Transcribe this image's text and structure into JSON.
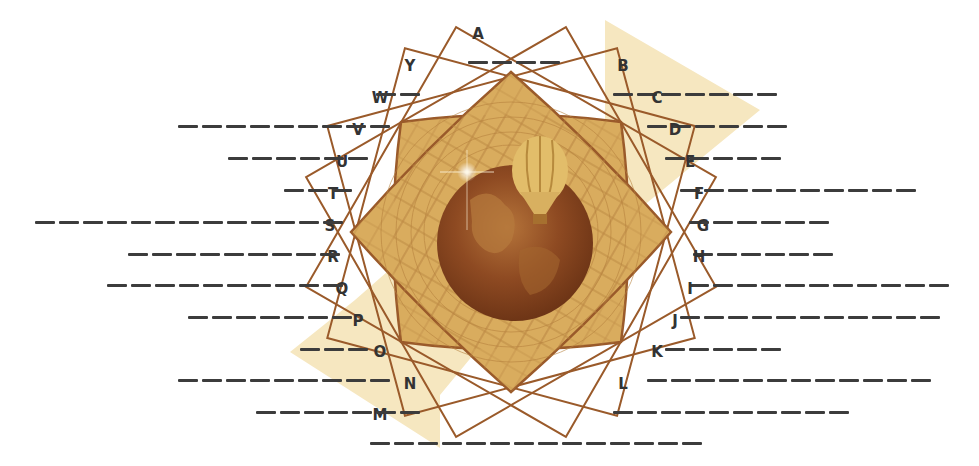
{
  "diagram": {
    "type": "fill-in-the-blank word puzzle around central emblem",
    "emblem": {
      "description": "golden geometric rosette (overlapping rotated squares with lattice) framing a sepia globe with a hot-air balloon and a sparkle",
      "icons": [
        "rosette-emblem",
        "globe-icon",
        "hot-air-balloon-icon",
        "sparkle-icon",
        "diagonal-arrow"
      ]
    },
    "colors": {
      "arrow_band": "#f6e7c0",
      "rosette_fill": "#d9ac5e",
      "rosette_stroke": "#9a5a2a",
      "globe": "#8e4a22",
      "globe_highlight": "#c98a45",
      "dash": "#3c3c3c",
      "letter": "#333333"
    }
  },
  "blanks": [
    {
      "letter": "A",
      "dashes": 4,
      "side": "right",
      "x": 468,
      "y": 44
    },
    {
      "letter": "B",
      "dashes": 7,
      "side": "right",
      "x": 613,
      "y": 76
    },
    {
      "letter": "C",
      "dashes": 6,
      "side": "right",
      "x": 647,
      "y": 108
    },
    {
      "letter": "D",
      "dashes": 5,
      "side": "right",
      "x": 665,
      "y": 140
    },
    {
      "letter": "E",
      "dashes": 10,
      "side": "right",
      "x": 680,
      "y": 172
    },
    {
      "letter": "F",
      "dashes": 6,
      "side": "right",
      "x": 689,
      "y": 204
    },
    {
      "letter": "G",
      "dashes": 6,
      "side": "right",
      "x": 693,
      "y": 236
    },
    {
      "letter": "H",
      "dashes": 11,
      "side": "right",
      "x": 689,
      "y": 267
    },
    {
      "letter": "I",
      "dashes": 11,
      "side": "right",
      "x": 680,
      "y": 299
    },
    {
      "letter": "J",
      "dashes": 5,
      "side": "right",
      "x": 665,
      "y": 331
    },
    {
      "letter": "K",
      "dashes": 12,
      "side": "right",
      "x": 647,
      "y": 362
    },
    {
      "letter": "L",
      "dashes": 10,
      "side": "right",
      "x": 613,
      "y": 394
    },
    {
      "letter": "M",
      "dashes": 14,
      "side": "right",
      "x": 370,
      "y": 425
    },
    {
      "letter": "N",
      "dashes": 7,
      "side": "left",
      "x": 420,
      "y": 394
    },
    {
      "letter": "O",
      "dashes": 9,
      "side": "left",
      "x": 390,
      "y": 362
    },
    {
      "letter": "P",
      "dashes": 3,
      "side": "left",
      "x": 368,
      "y": 331
    },
    {
      "letter": "Q",
      "dashes": 7,
      "side": "left",
      "x": 352,
      "y": 299
    },
    {
      "letter": "R",
      "dashes": 10,
      "side": "left",
      "x": 343,
      "y": 267
    },
    {
      "letter": "S",
      "dashes": 9,
      "side": "left",
      "x": 340,
      "y": 236
    },
    {
      "letter": "T",
      "dashes": 13,
      "side": "left",
      "x": 343,
      "y": 204
    },
    {
      "letter": "U",
      "dashes": 3,
      "side": "left",
      "x": 352,
      "y": 172
    },
    {
      "letter": "V",
      "dashes": 6,
      "side": "left",
      "x": 368,
      "y": 140
    },
    {
      "letter": "W",
      "dashes": 9,
      "side": "left",
      "x": 390,
      "y": 108
    },
    {
      "letter": "Y",
      "dashes": 2,
      "side": "left",
      "x": 420,
      "y": 76
    }
  ]
}
